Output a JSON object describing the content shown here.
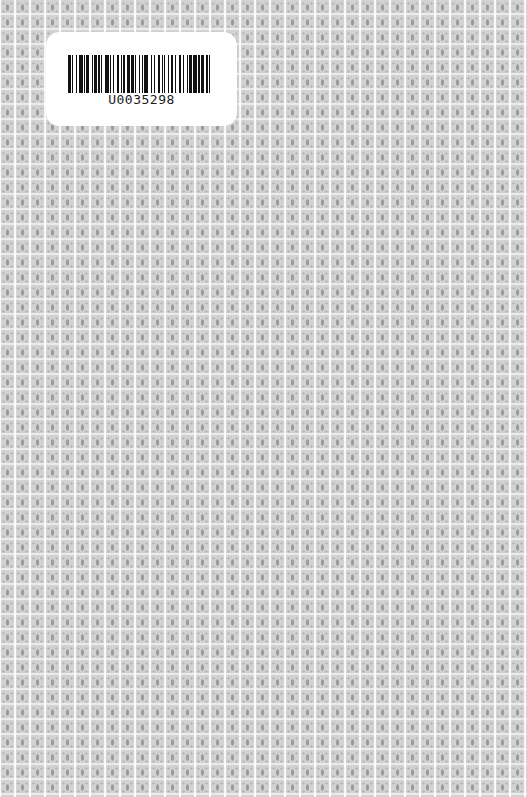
{
  "cover": {
    "pattern": "repeating-square-floral-tile",
    "background_color": "#f6f6f6",
    "motif_color": "#9a9a9a"
  },
  "barcode_label": {
    "number": "U0035298",
    "bar_color": "#111111",
    "label_color": "#ffffff",
    "bars": [
      2,
      1,
      1,
      2,
      1,
      1,
      3,
      1,
      1,
      1,
      2,
      2,
      1,
      1,
      2,
      1,
      1,
      1,
      1,
      2,
      3,
      1,
      1,
      1,
      1,
      2,
      2,
      1,
      1,
      1,
      1,
      2,
      2,
      1,
      2,
      1,
      1,
      2,
      1,
      1,
      1,
      1,
      3,
      2,
      1,
      1,
      1,
      2,
      2,
      1,
      1,
      1,
      1,
      2,
      1,
      1,
      2,
      1,
      1,
      2,
      2,
      1,
      1,
      2,
      1,
      1,
      2,
      1,
      3,
      1,
      1,
      1,
      2,
      2,
      1,
      1,
      1,
      2
    ]
  }
}
